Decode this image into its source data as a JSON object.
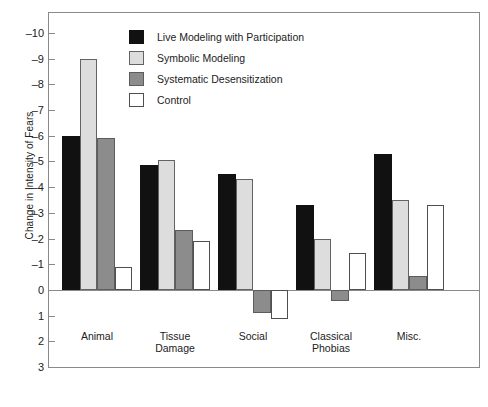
{
  "chart_data": {
    "type": "bar",
    "title": "",
    "xlabel": "",
    "ylabel": "Change in Intensity of Fears",
    "categories": [
      "Animal",
      "Tissue\nDamage",
      "Social",
      "Classical\nPhobias",
      "Misc."
    ],
    "series": [
      {
        "name": "Live Modeling with Participation",
        "color": "#111111",
        "values": [
          -6.0,
          -4.85,
          -4.5,
          -3.3,
          -5.3
        ]
      },
      {
        "name": "Symbolic Modeling",
        "color": "#dddddd",
        "values": [
          -9.0,
          -5.05,
          -4.3,
          -2.0,
          -3.5
        ]
      },
      {
        "name": "Systematic Desensitization",
        "color": "#8c8c8c",
        "values": [
          -5.9,
          -2.35,
          0.9,
          0.45,
          -0.55
        ]
      },
      {
        "name": "Control",
        "color": "#ffffff",
        "values": [
          -0.9,
          -1.9,
          1.15,
          -1.45,
          -3.3
        ]
      }
    ],
    "ylim": [
      -10,
      3
    ],
    "yticks": [
      -10,
      -9,
      -8,
      -7,
      -6,
      -5,
      -4,
      -3,
      -2,
      -1,
      0,
      1,
      2,
      3
    ],
    "ytick_labels": [
      "–10",
      "–9",
      "–8",
      "–7",
      "–6",
      "–5",
      "–4",
      "–3",
      "–2",
      "–1",
      "0",
      "1",
      "2",
      "3"
    ],
    "grid": false,
    "legend_position": "top-center",
    "zero_reference": 0
  },
  "legend": {
    "entries": [
      {
        "label": "Live Modeling with Participation",
        "swatch": "black-swatch-icon"
      },
      {
        "label": "Symbolic Modeling",
        "swatch": "light-gray-swatch-icon"
      },
      {
        "label": "Systematic Desensitization",
        "swatch": "medium-gray-swatch-icon"
      },
      {
        "label": "Control",
        "swatch": "white-swatch-icon"
      }
    ]
  }
}
